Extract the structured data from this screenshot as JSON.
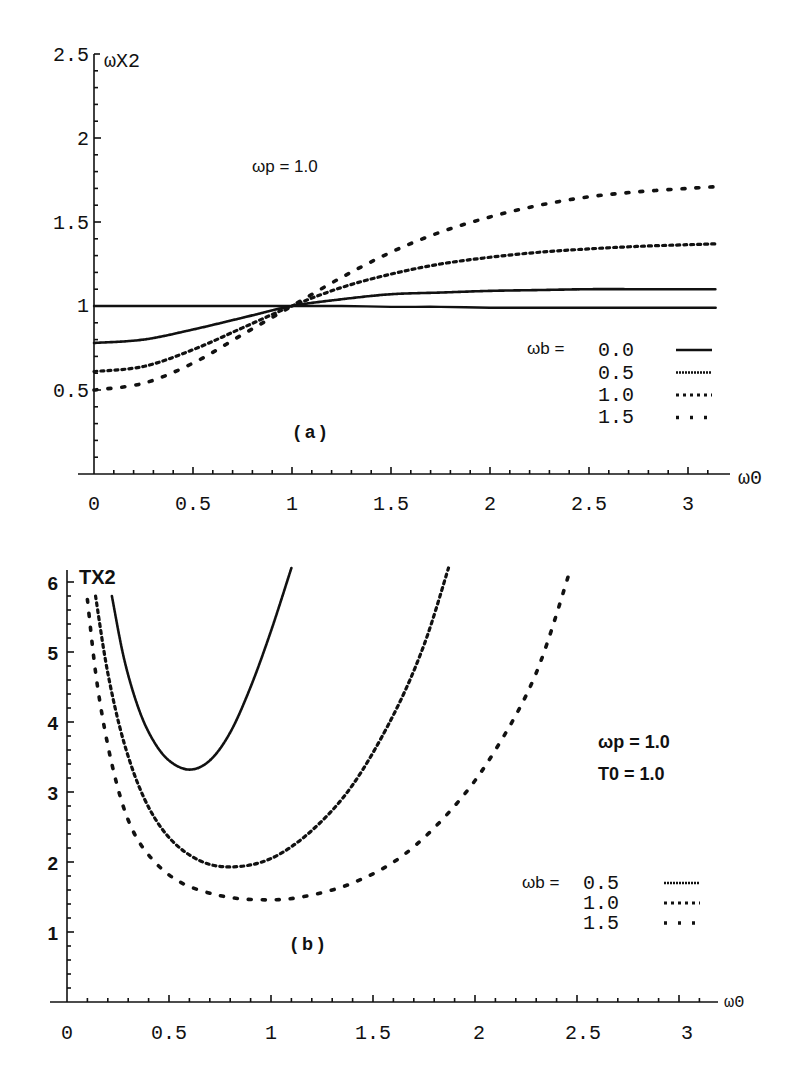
{
  "chart_data": [
    {
      "id": "a",
      "type": "line",
      "panel_label": "( a )",
      "ylabel": "ωX2",
      "xlabel": "ω0",
      "annotation": "ωp = 1.0",
      "legend_title": "ωb =",
      "xlim": [
        0,
        3.14
      ],
      "ylim": [
        0,
        2.5
      ],
      "xticks": [
        "0",
        "0.5",
        "1",
        "1.5",
        "2",
        "2.5",
        "3"
      ],
      "yticks": [
        "0.5",
        "1",
        "1.5",
        "2",
        "2.5"
      ],
      "x": [
        0,
        0.25,
        0.5,
        0.75,
        1.0,
        1.25,
        1.5,
        1.75,
        2.0,
        2.25,
        2.5,
        2.75,
        3.0,
        3.14
      ],
      "series": [
        {
          "name": "0.0",
          "style": "solid",
          "values": [
            1.0,
            1.0,
            1.0,
            1.0,
            1.0,
            1.0,
            0.995,
            0.995,
            0.99,
            0.99,
            0.99,
            0.99,
            0.99,
            0.99
          ]
        },
        {
          "name": "0.5",
          "style": "fine-dotted",
          "values": [
            0.78,
            0.8,
            0.86,
            0.93,
            1.0,
            1.04,
            1.07,
            1.08,
            1.09,
            1.095,
            1.1,
            1.1,
            1.1,
            1.1
          ]
        },
        {
          "name": "1.0",
          "style": "dotted",
          "values": [
            0.61,
            0.64,
            0.74,
            0.87,
            1.0,
            1.11,
            1.19,
            1.25,
            1.29,
            1.32,
            1.34,
            1.355,
            1.365,
            1.37
          ]
        },
        {
          "name": "1.5",
          "style": "sparse-dotted",
          "values": [
            0.5,
            0.54,
            0.66,
            0.83,
            1.0,
            1.17,
            1.32,
            1.44,
            1.53,
            1.6,
            1.65,
            1.68,
            1.7,
            1.71
          ]
        }
      ]
    },
    {
      "id": "b",
      "type": "line",
      "panel_label": "( b )",
      "ylabel": "TX2",
      "xlabel": "ω0",
      "annotation": [
        "ωp = 1.0",
        "T0   = 1.0"
      ],
      "legend_title": "ωb =",
      "xlim": [
        0,
        3.2
      ],
      "ylim": [
        0,
        6.2
      ],
      "xticks": [
        "0",
        "0.5",
        "1",
        "1.5",
        "2",
        "2.5",
        "3"
      ],
      "yticks": [
        "1",
        "2",
        "3",
        "4",
        "5",
        "6"
      ],
      "series": [
        {
          "name": "0.5",
          "style": "fine-dotted",
          "x": [
            0.22,
            0.28,
            0.35,
            0.42,
            0.5,
            0.6,
            0.7,
            0.8,
            0.9,
            1.0,
            1.1
          ],
          "values": [
            5.8,
            4.9,
            4.2,
            3.75,
            3.45,
            3.32,
            3.45,
            3.85,
            4.5,
            5.3,
            6.2
          ]
        },
        {
          "name": "1.0",
          "style": "dotted",
          "x": [
            0.14,
            0.2,
            0.28,
            0.38,
            0.5,
            0.65,
            0.81,
            1.0,
            1.2,
            1.4,
            1.6,
            1.75,
            1.87
          ],
          "values": [
            5.8,
            4.7,
            3.7,
            2.9,
            2.35,
            2.02,
            1.93,
            2.05,
            2.45,
            3.1,
            4.1,
            5.1,
            6.2
          ]
        },
        {
          "name": "1.5",
          "style": "sparse-dotted",
          "x": [
            0.1,
            0.15,
            0.22,
            0.3,
            0.4,
            0.55,
            0.75,
            0.95,
            1.15,
            1.4,
            1.65,
            1.9,
            2.1,
            2.3,
            2.47
          ],
          "values": [
            5.75,
            4.5,
            3.4,
            2.6,
            2.1,
            1.72,
            1.52,
            1.46,
            1.5,
            1.7,
            2.1,
            2.8,
            3.6,
            4.7,
            6.2
          ]
        }
      ]
    }
  ],
  "labels": {
    "a_ylabel": "ωX2",
    "a_xlabel": "ω0",
    "a_annotation": "ωp = 1.0",
    "a_panel": "( a )",
    "a_legend_title": "ωb =",
    "a_legend": [
      "0.0",
      "0.5",
      "1.0",
      "1.5"
    ],
    "a_xticks": [
      "0",
      "0.5",
      "1",
      "1.5",
      "2",
      "2.5",
      "3"
    ],
    "a_yticks": [
      "2.5",
      "2",
      "1.5",
      "1",
      "0.5"
    ],
    "b_ylabel": "TX2",
    "b_xlabel": "ω0",
    "b_annotation_1": "ωp = 1.0",
    "b_annotation_2": "T0   = 1.0",
    "b_panel": "( b )",
    "b_legend_title": "ωb =",
    "b_legend": [
      "0.5",
      "1.0",
      "1.5"
    ],
    "b_xticks": [
      "0",
      "0.5",
      "1",
      "1.5",
      "2",
      "2.5",
      "3"
    ],
    "b_yticks": [
      "6",
      "5",
      "4",
      "3",
      "2",
      "1"
    ]
  }
}
